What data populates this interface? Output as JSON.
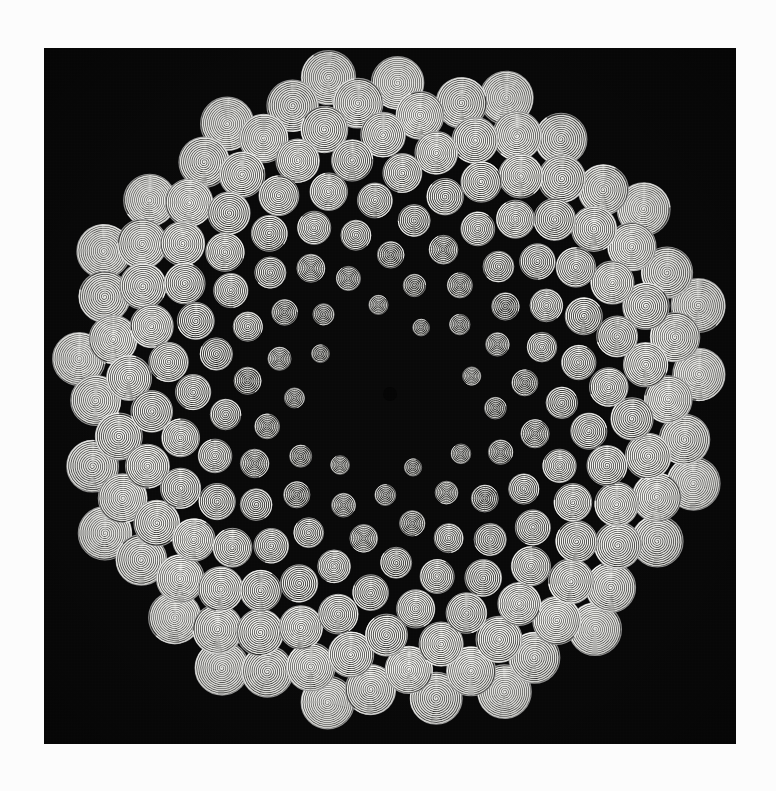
{
  "artwork": {
    "title": "Phyllotaxis Spiral Discs",
    "alt_text": "Concentric spiral discs arranged in a golden-angle phyllotaxis pattern on a black square field",
    "medium": "generative pattern",
    "canvas": {
      "background_color": "#090909",
      "page_background_color": "#fcfcfc",
      "left": 44,
      "top": 48,
      "width": 692,
      "height": 696
    },
    "palette": {
      "background": "#090909",
      "page": "#fcfcfc",
      "spiral_stroke": "#f2f2ee",
      "disc_fill": "#1a1a18",
      "rim_highlight": "#ffffff",
      "void_center": "#050505"
    }
  },
  "pattern": {
    "type": "phyllotaxis",
    "arrangement": "Vogel sunflower spiral",
    "divergence_angle_deg": 137.507764,
    "point_count": 184,
    "first_index": 10,
    "radius_scale": 23.2,
    "radius_exponent": 0.5,
    "center_x": 346,
    "center_y": 346,
    "center_void_radius": 7,
    "disc": {
      "shape": "archimedean-spiral",
      "min_radius": 3.0,
      "max_radius": 27.5,
      "radius_growth_per_unit_distance": 0.0755,
      "turns_min": 3,
      "turns_max": 13,
      "stroke_width_min": 0.55,
      "stroke_width_max": 1.5,
      "spiral_phase_jitter_deg": 360,
      "rotation_direction": "counter-clockwise"
    },
    "field_radius": 330
  },
  "chart_data": {
    "type": "scatter",
    "xlabel": "",
    "ylabel": "",
    "n_points": 184,
    "c": 23.2,
    "golden_angle_deg": 137.507764,
    "marker_radius_formula": "0.0755 * r + 3.0",
    "xlim": [
      -346,
      346
    ],
    "ylim": [
      -346,
      346
    ],
    "grid": false,
    "legend": null
  }
}
